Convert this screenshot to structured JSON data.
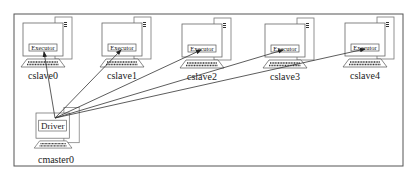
{
  "diagram": {
    "title_fragment": "",
    "driver": {
      "label": "Driver",
      "host": "cmaster0"
    },
    "slaves": [
      {
        "host": "cslave0",
        "component": "Executor"
      },
      {
        "host": "cslave1",
        "component": "Executor"
      },
      {
        "host": "cslave2",
        "component": "Executor"
      },
      {
        "host": "cslave3",
        "component": "Executor"
      },
      {
        "host": "cslave4",
        "component": "Executor"
      }
    ],
    "connections": [
      {
        "from": "cmaster0",
        "to": "cslave0"
      },
      {
        "from": "cmaster0",
        "to": "cslave1"
      },
      {
        "from": "cmaster0",
        "to": "cslave2"
      },
      {
        "from": "cmaster0",
        "to": "cslave3"
      },
      {
        "from": "cmaster0",
        "to": "cslave4"
      }
    ],
    "colors": {
      "line": "#333333",
      "border": "#555555",
      "background": "#ffffff"
    }
  }
}
